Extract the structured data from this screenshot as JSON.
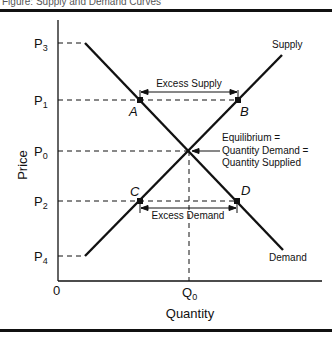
{
  "figure": {
    "caption": "Figure: Supply and Demand Curves",
    "y_axis_label": "Price",
    "x_axis_label": "Quantity",
    "origin_label": "0",
    "price_levels": [
      {
        "key": "P",
        "sub": "3",
        "y": 43
      },
      {
        "key": "P",
        "sub": "1",
        "y": 100
      },
      {
        "key": "P",
        "sub": "0",
        "y": 151
      },
      {
        "key": "P",
        "sub": "2",
        "y": 201
      },
      {
        "key": "P",
        "sub": "4",
        "y": 256
      }
    ],
    "quantity_label": {
      "key": "Q",
      "sub": "0"
    },
    "curves": {
      "supply_label": "Supply",
      "demand_label": "Demand"
    },
    "points": {
      "A": "A",
      "B": "B",
      "C": "C",
      "D": "D"
    },
    "annotations": {
      "excess_supply": "Excess Supply",
      "excess_demand": "Excess Demand",
      "equilibrium_line1": "Equilibrium =",
      "equilibrium_line2": "Quantity Demand =",
      "equilibrium_line3": "Quantity Supplied"
    },
    "colors": {
      "ink": "#111111",
      "background": "#ffffff"
    }
  }
}
